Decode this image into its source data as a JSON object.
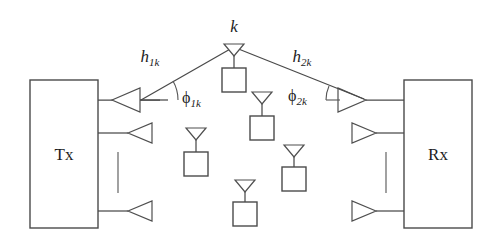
{
  "figure": {
    "name": "mimo-scattering-channel-diagram",
    "background": "#ffffff",
    "line_color": "#4a4a4a",
    "text_color": "#1d1d1d",
    "width": 503,
    "height": 246
  },
  "terminals": {
    "transmitter": {
      "label": "Tx",
      "box": {
        "x": 30,
        "y": 80,
        "width": 68,
        "height": 148
      },
      "antenna_count": 3,
      "antenna_direction": "left",
      "ellipsis": "vertical-dash"
    },
    "receiver": {
      "label": "Rx",
      "box": {
        "x": 404,
        "y": 80,
        "width": 68,
        "height": 148
      },
      "antenna_count": 3,
      "antenna_direction": "right",
      "ellipsis": "vertical-dash"
    }
  },
  "scatterer_k": {
    "label": "k",
    "x": 234,
    "y": 44,
    "icon": "antenna-with-box"
  },
  "paths": [
    {
      "name": "path-tx-to-scatterer",
      "label": "h",
      "subscript": "1k",
      "label_x": 150,
      "label_y": 62,
      "angle_label": "ϕ",
      "angle_subscript": "1k",
      "angle_label_x": 182,
      "angle_label_y": 100,
      "arrow_at": "tx"
    },
    {
      "name": "path-scatterer-to-rx",
      "label": "h",
      "subscript": "2k",
      "label_x": 302,
      "label_y": 62,
      "angle_label": "ϕ",
      "angle_subscript": "2k",
      "angle_label_x": 296,
      "angle_label_y": 98,
      "arrow_at": "rx"
    }
  ],
  "scatterers": [
    {
      "name": "scatterer-center-upper",
      "x": 234,
      "y": 44,
      "primary": true
    },
    {
      "name": "scatterer-left-mid",
      "x": 196,
      "y": 128
    },
    {
      "name": "scatterer-right-upper",
      "x": 262,
      "y": 92
    },
    {
      "name": "scatterer-right-mid",
      "x": 294,
      "y": 145
    },
    {
      "name": "scatterer-bottom-center",
      "x": 245,
      "y": 180
    }
  ],
  "icons": {
    "antenna_left": "antenna-left-triangle-icon",
    "antenna_right": "antenna-right-triangle-icon",
    "scatterer": "scatterer-antenna-box-icon",
    "ellipsis": "vertical-ellipsis-icon",
    "angle_arc": "angle-arc-icon"
  }
}
